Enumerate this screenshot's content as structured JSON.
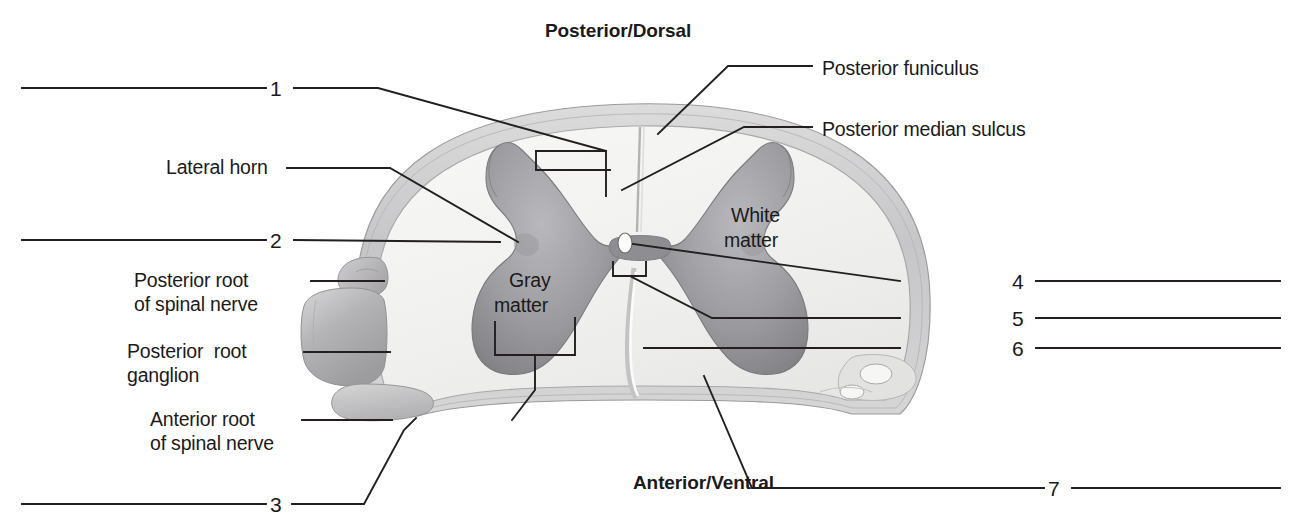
{
  "figure": {
    "title_top": "Posterior/Dorsal",
    "title_bottom": "Anterior/Ventral"
  },
  "inline_labels": {
    "white_matter_line1": "White",
    "white_matter_line2": "matter",
    "gray_matter_line1": "Gray",
    "gray_matter_line2": "matter"
  },
  "left_labels": [
    {
      "id": "num1",
      "text": "1"
    },
    {
      "id": "lateral_horn",
      "text": "Lateral horn"
    },
    {
      "id": "num2",
      "text": "2"
    },
    {
      "id": "posterior_root_l1",
      "text": "Posterior root"
    },
    {
      "id": "posterior_root_l2",
      "text": "of spinal nerve"
    },
    {
      "id": "ganglion_l1",
      "text": "Posterior  root"
    },
    {
      "id": "ganglion_l2",
      "text": "ganglion"
    },
    {
      "id": "anterior_root_l1",
      "text": "Anterior root"
    },
    {
      "id": "anterior_root_l2",
      "text": "of spinal nerve"
    },
    {
      "id": "num3",
      "text": "3"
    }
  ],
  "right_labels": [
    {
      "id": "posterior_funiculus",
      "text": "Posterior funiculus"
    },
    {
      "id": "posterior_median_sulcus",
      "text": "Posterior median sulcus"
    },
    {
      "id": "num4",
      "text": "4"
    },
    {
      "id": "num5",
      "text": "5"
    },
    {
      "id": "num6",
      "text": "6"
    },
    {
      "id": "num7",
      "text": "7"
    }
  ],
  "colors": {
    "ink": "#1a1a1a",
    "leader": "#231f20",
    "gray_matter_dark": "#8e8e90",
    "gray_matter_mid": "#a9a9ad",
    "white_matter": "#f2f2f0",
    "outer_rim": "#c9c9ca",
    "ganglion": "#b8b8ba"
  }
}
